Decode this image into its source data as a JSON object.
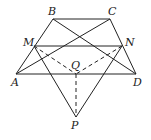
{
  "diagram": {
    "stroke_color": "#222222",
    "points": [
      {
        "id": "B",
        "label": "B",
        "x": 53,
        "y": 19,
        "lx": 48,
        "ly": 15
      },
      {
        "id": "C",
        "label": "C",
        "x": 110,
        "y": 19,
        "lx": 108,
        "ly": 15
      },
      {
        "id": "M",
        "label": "M",
        "x": 34,
        "y": 46,
        "lx": 23,
        "ly": 46
      },
      {
        "id": "N",
        "label": "N",
        "x": 122,
        "y": 46,
        "lx": 125,
        "ly": 46
      },
      {
        "id": "A",
        "label": "A",
        "x": 16,
        "y": 74,
        "lx": 11,
        "ly": 86
      },
      {
        "id": "D",
        "label": "D",
        "x": 136,
        "y": 74,
        "lx": 133,
        "ly": 86
      },
      {
        "id": "Q",
        "label": "Q",
        "x": 76,
        "y": 74,
        "lx": 71,
        "ly": 69
      },
      {
        "id": "P",
        "label": "P",
        "x": 76,
        "y": 117,
        "lx": 71,
        "ly": 129
      }
    ],
    "segments": [
      {
        "from": "B",
        "to": "C",
        "dashed": false
      },
      {
        "from": "A",
        "to": "B",
        "dashed": false
      },
      {
        "from": "D",
        "to": "C",
        "dashed": false
      },
      {
        "from": "A",
        "to": "D",
        "dashed": false
      },
      {
        "from": "M",
        "to": "N",
        "dashed": false
      },
      {
        "from": "A",
        "to": "C",
        "dashed": false
      },
      {
        "from": "B",
        "to": "D",
        "dashed": false
      },
      {
        "from": "M",
        "to": "P",
        "dashed": false
      },
      {
        "from": "N",
        "to": "P",
        "dashed": false
      },
      {
        "from": "M",
        "to": "Q",
        "dashed": true
      },
      {
        "from": "N",
        "to": "Q",
        "dashed": true
      },
      {
        "from": "Q",
        "to": "P",
        "dashed": true
      }
    ]
  }
}
